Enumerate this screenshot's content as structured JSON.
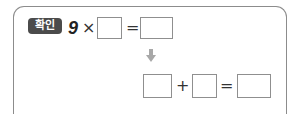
{
  "problem": {
    "badge_label": "확인",
    "row1": {
      "multiplicand": "9",
      "times_symbol": "×",
      "equals_symbol": "=",
      "blank_1": "",
      "blank_2": ""
    },
    "arrow_icon": "down-arrow",
    "row2": {
      "plus_symbol": "+",
      "equals_symbol": "=",
      "blank_1": "",
      "blank_2": "",
      "blank_3": ""
    }
  },
  "colors": {
    "badge_bg": "#4b4b4b",
    "border": "#8c8c8c",
    "arrow": "#a8a8a8"
  }
}
